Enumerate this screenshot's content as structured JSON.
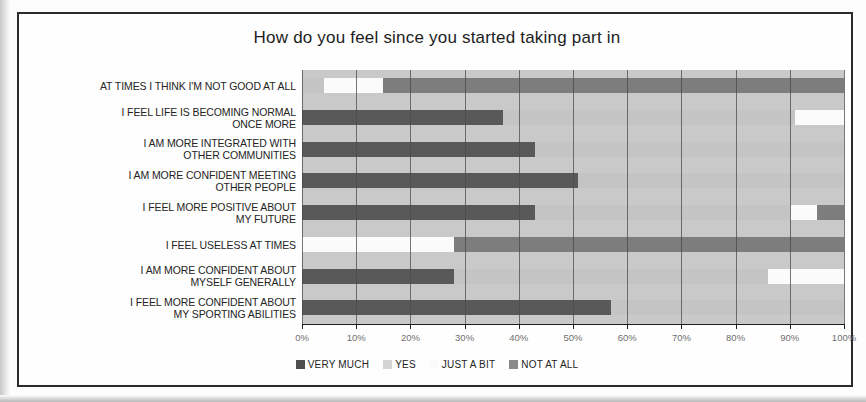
{
  "chart_data": {
    "type": "bar",
    "subtype": "100% stacked horizontal bar",
    "title": "How do you feel since you started taking part in",
    "xlabel": "",
    "ylabel": "",
    "xlim": [
      0,
      100
    ],
    "xticks": [
      "0%",
      "10%",
      "20%",
      "30%",
      "40%",
      "50%",
      "60%",
      "70%",
      "80%",
      "90%",
      "100%"
    ],
    "grid": true,
    "legend_position": "bottom",
    "categories": [
      "AT TIMES I THINK I'M NOT GOOD AT ALL",
      "I FEEL LIFE IS BECOMING NORMAL ONCE MORE",
      "I AM MORE INTEGRATED WITH OTHER COMMUNITIES",
      "I AM MORE CONFIDENT MEETING OTHER PEOPLE",
      "I FEEL MORE POSITIVE ABOUT MY FUTURE",
      "I FEEL USELESS AT TIMES",
      "I AM MORE CONFIDENT ABOUT MYSELF GENERALLY",
      "I FEEL MORE CONFIDENT ABOUT MY SPORTING ABILITIES"
    ],
    "series": [
      {
        "name": "VERY MUCH",
        "color": "#595959",
        "values": [
          4,
          37,
          43,
          51,
          43,
          0,
          28,
          57
        ]
      },
      {
        "name": "YES",
        "color": "#fbfbfb",
        "values": [
          11,
          0,
          0,
          0,
          0,
          28,
          0,
          0
        ]
      },
      {
        "name": "JUST A BIT",
        "color": "#c4c4c4",
        "values": [
          0,
          53,
          57,
          49,
          47,
          0,
          58,
          43
        ]
      },
      {
        "name": "NOT AT ALL",
        "color": "#7d7d7d",
        "values": [
          85,
          10,
          0,
          0,
          10,
          72,
          14,
          0
        ]
      }
    ],
    "stacks": [
      [
        {
          "series": "JUST A BIT",
          "from": 0,
          "to": 4
        },
        {
          "series": "YES",
          "from": 4,
          "to": 15
        },
        {
          "series": "NOT AT ALL",
          "from": 15,
          "to": 100
        }
      ],
      [
        {
          "series": "VERY MUCH",
          "from": 0,
          "to": 37
        },
        {
          "series": "JUST A BIT",
          "from": 37,
          "to": 91
        },
        {
          "series": "YES",
          "from": 91,
          "to": 100
        }
      ],
      [
        {
          "series": "VERY MUCH",
          "from": 0,
          "to": 43
        },
        {
          "series": "JUST A BIT",
          "from": 43,
          "to": 100
        }
      ],
      [
        {
          "series": "VERY MUCH",
          "from": 0,
          "to": 51
        },
        {
          "series": "JUST A BIT",
          "from": 51,
          "to": 100
        }
      ],
      [
        {
          "series": "VERY MUCH",
          "from": 0,
          "to": 43
        },
        {
          "series": "JUST A BIT",
          "from": 43,
          "to": 90
        },
        {
          "series": "YES",
          "from": 90,
          "to": 95
        },
        {
          "series": "NOT AT ALL",
          "from": 95,
          "to": 100
        }
      ],
      [
        {
          "series": "YES",
          "from": 0,
          "to": 28
        },
        {
          "series": "NOT AT ALL",
          "from": 28,
          "to": 100
        }
      ],
      [
        {
          "series": "VERY MUCH",
          "from": 0,
          "to": 28
        },
        {
          "series": "JUST A BIT",
          "from": 28,
          "to": 86
        },
        {
          "series": "YES",
          "from": 86,
          "to": 100
        }
      ],
      [
        {
          "series": "VERY MUCH",
          "from": 0,
          "to": 57
        },
        {
          "series": "JUST A BIT",
          "from": 57,
          "to": 100
        }
      ]
    ]
  },
  "chart": {
    "title": "How do you feel since you started taking part in",
    "categories": [
      {
        "line1": "AT TIMES I THINK I'M NOT GOOD AT ALL",
        "line2": ""
      },
      {
        "line1": "I FEEL LIFE IS BECOMING NORMAL",
        "line2": "ONCE MORE"
      },
      {
        "line1": "I AM MORE INTEGRATED WITH",
        "line2": "OTHER COMMUNITIES"
      },
      {
        "line1": "I AM MORE CONFIDENT MEETING",
        "line2": "OTHER PEOPLE"
      },
      {
        "line1": "I FEEL MORE POSITIVE ABOUT",
        "line2": "MY FUTURE"
      },
      {
        "line1": "I FEEL USELESS AT TIMES",
        "line2": ""
      },
      {
        "line1": "I AM MORE CONFIDENT ABOUT",
        "line2": "MYSELF GENERALLY"
      },
      {
        "line1": "I FEEL MORE CONFIDENT ABOUT",
        "line2": "MY SPORTING ABILITIES"
      }
    ],
    "xticks": [
      "0%",
      "10%",
      "20%",
      "30%",
      "40%",
      "50%",
      "60%",
      "70%",
      "80%",
      "90%",
      "100%"
    ],
    "legend": [
      {
        "label": "VERY MUCH",
        "color": "#4e4e4e"
      },
      {
        "label": "YES",
        "color": "#d4d4d4"
      },
      {
        "label": "JUST A BIT",
        "color": "#fbfbfb"
      },
      {
        "label": "NOT AT ALL",
        "color": "#8a8a8a"
      }
    ]
  }
}
